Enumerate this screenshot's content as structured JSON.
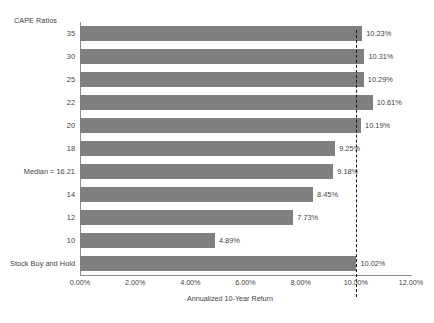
{
  "chart_data": {
    "type": "bar",
    "orientation": "horizontal",
    "title": "",
    "xlabel": "Annualized 10-Year Return",
    "ylabel": "CAPE Ratios",
    "categories": [
      "35",
      "30",
      "25",
      "22",
      "20",
      "18",
      "Median = 16.21",
      "14",
      "12",
      "10",
      "Stock Buy and Hold"
    ],
    "values": [
      10.23,
      10.31,
      10.29,
      10.61,
      10.19,
      9.25,
      9.18,
      8.45,
      7.73,
      4.89,
      10.02
    ],
    "value_labels": [
      "10.23%",
      "10.31%",
      "10.29%",
      "10.61%",
      "10.19%",
      "9.25%",
      "9.18%",
      "8.45%",
      "7.73%",
      "4.89%",
      "10.02%"
    ],
    "xlim": [
      0,
      12
    ],
    "xticks": [
      0,
      2,
      4,
      6,
      8,
      10,
      12
    ],
    "xtick_labels": [
      "0.00%",
      "2.00%",
      "4.00%",
      "6.00%",
      "8.00%",
      "10.00%",
      "12.00%"
    ],
    "grid": false,
    "legend": "none",
    "bar_color": "#7f7f7f",
    "reference_line": {
      "value": 10.02,
      "style": "dashed",
      "color": "#17171a"
    }
  }
}
